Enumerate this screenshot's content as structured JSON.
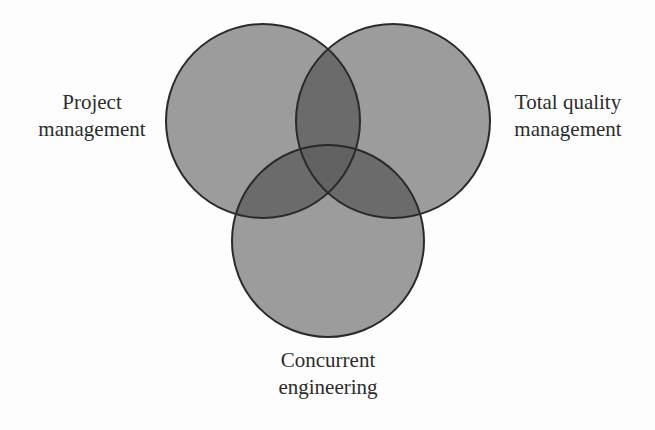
{
  "diagram": {
    "type": "venn",
    "colors": {
      "background": "#fdfdfd",
      "single": "#9c9c9c",
      "double": "#6b6b6b",
      "triple": "#626262",
      "outline": "#2a2a2a",
      "text": "#2c2c2c"
    },
    "sets": [
      {
        "id": "project",
        "line1": "Project",
        "line2": "management"
      },
      {
        "id": "tqm",
        "line1": "Total quality",
        "line2": "management"
      },
      {
        "id": "concurrent",
        "line1": "Concurrent",
        "line2": "engineering"
      }
    ]
  }
}
